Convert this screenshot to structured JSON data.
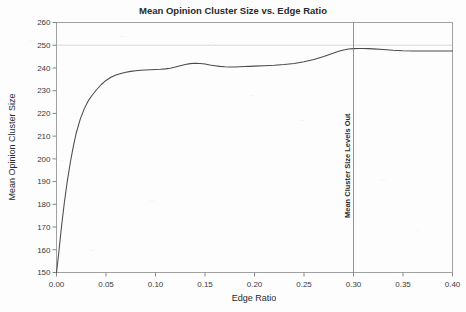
{
  "chart_data": {
    "type": "line",
    "title": "Mean Opinion Cluster Size vs. Edge Ratio",
    "xlabel": "Edge Ratio",
    "ylabel": "Mean Opinion Cluster Size",
    "xlim": [
      0.0,
      0.4
    ],
    "ylim": [
      150,
      260
    ],
    "xticks": [
      0.0,
      0.05,
      0.1,
      0.15,
      0.2,
      0.25,
      0.3,
      0.35,
      0.4
    ],
    "xtick_labels": [
      "0.00",
      "0.05",
      "0.10",
      "0.15",
      "0.20",
      "0.25",
      "0.30",
      "0.35",
      "0.40"
    ],
    "yticks": [
      150,
      160,
      170,
      180,
      190,
      200,
      210,
      220,
      230,
      240,
      250,
      260
    ],
    "ytick_labels": [
      "150",
      "160",
      "170",
      "180",
      "190",
      "200",
      "210",
      "220",
      "230",
      "240",
      "250",
      "260"
    ],
    "grid": false,
    "legend": null,
    "line_color": "#4a4a4a",
    "annotations": [
      {
        "type": "vline",
        "label": "Mean Cluster Size Levels Out",
        "x": 0.3,
        "orientation": "vertical",
        "color": "#7a7a7a"
      },
      {
        "type": "hline",
        "label": "",
        "y": 250,
        "orientation": "horizontal",
        "color": "#c9c9c9"
      }
    ],
    "series": [
      {
        "name": "Mean Opinion Cluster Size",
        "x": [
          0.0,
          0.002,
          0.005,
          0.008,
          0.011,
          0.014,
          0.017,
          0.02,
          0.024,
          0.028,
          0.032,
          0.036,
          0.04,
          0.045,
          0.05,
          0.055,
          0.06,
          0.065,
          0.07,
          0.075,
          0.08,
          0.085,
          0.09,
          0.095,
          0.1,
          0.105,
          0.11,
          0.115,
          0.12,
          0.125,
          0.13,
          0.135,
          0.14,
          0.145,
          0.15,
          0.155,
          0.16,
          0.165,
          0.17,
          0.175,
          0.18,
          0.185,
          0.19,
          0.195,
          0.2,
          0.21,
          0.22,
          0.23,
          0.24,
          0.25,
          0.26,
          0.27,
          0.28,
          0.285,
          0.29,
          0.295,
          0.3,
          0.305,
          0.31,
          0.315,
          0.32,
          0.33,
          0.34,
          0.35,
          0.36,
          0.37,
          0.38,
          0.39,
          0.4
        ],
        "y": [
          150.0,
          157.5,
          170.0,
          181.0,
          190.5,
          198.5,
          205.5,
          211.5,
          217.5,
          222.0,
          225.5,
          228.0,
          230.2,
          232.6,
          234.5,
          235.9,
          236.9,
          237.6,
          238.1,
          238.5,
          238.8,
          239.0,
          239.1,
          239.2,
          239.3,
          239.4,
          239.6,
          239.9,
          240.4,
          241.0,
          241.5,
          241.9,
          242.1,
          242.0,
          241.7,
          241.3,
          241.0,
          240.7,
          240.5,
          240.4,
          240.4,
          240.5,
          240.6,
          240.7,
          240.8,
          241.0,
          241.2,
          241.5,
          242.0,
          242.7,
          243.7,
          245.0,
          246.6,
          247.3,
          247.9,
          248.3,
          248.5,
          248.6,
          248.6,
          248.5,
          248.4,
          248.1,
          247.8,
          247.6,
          247.5,
          247.5,
          247.5,
          247.5,
          247.5
        ]
      }
    ]
  }
}
